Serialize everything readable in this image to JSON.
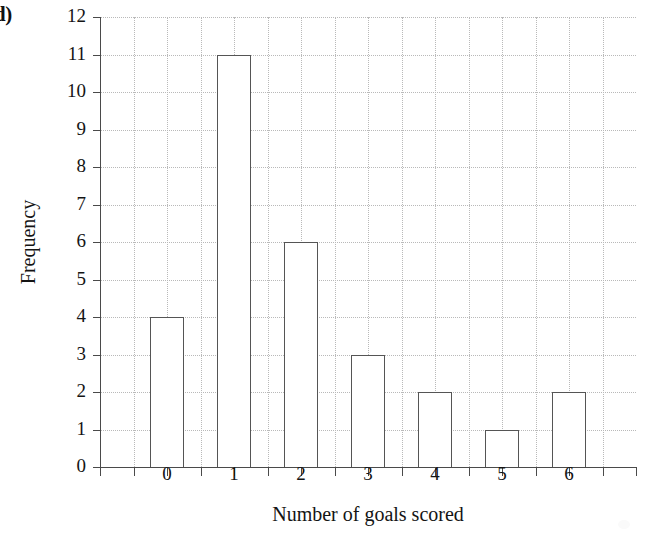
{
  "figure": {
    "part_label": "d)"
  },
  "chart_data": {
    "type": "bar",
    "title": "",
    "xlabel": "Number of goals scored",
    "ylabel": "Frequency",
    "categories": [
      "0",
      "1",
      "2",
      "3",
      "4",
      "5",
      "6"
    ],
    "values": [
      4,
      11,
      6,
      3,
      2,
      1,
      2
    ],
    "ylim": [
      0,
      12
    ],
    "ytick_labels": [
      "0",
      "1",
      "2",
      "3",
      "4",
      "5",
      "6",
      "7",
      "8",
      "9",
      "10",
      "11",
      "12"
    ],
    "ytick_values": [
      0,
      1,
      2,
      3,
      4,
      5,
      6,
      7,
      8,
      9,
      10,
      11,
      12
    ],
    "xtick_labels": [
      "0",
      "1",
      "2",
      "3",
      "4",
      "5",
      "6"
    ],
    "grid": "dotted-both-axes",
    "bar_style": "unfilled-outline",
    "bar_width_units": 0.5,
    "legend": "none",
    "colors": {
      "bar_fill": "#ffffff",
      "bar_edge": "#555555",
      "gridline": "#b9b9b9",
      "axis": "#4a4a4a",
      "text": "#141414",
      "background": "#ffffff"
    }
  }
}
